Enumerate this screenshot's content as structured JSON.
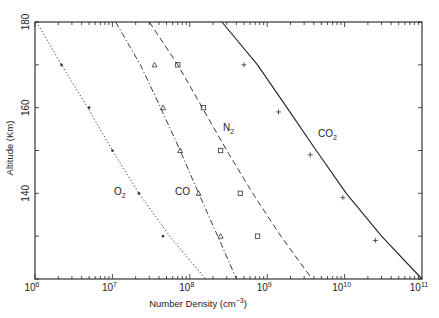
{
  "chart_data": {
    "type": "line",
    "title": "",
    "xlabel": "Number Density (cm⁻³)",
    "ylabel": "Altitude (Km)",
    "xscale": "log",
    "xlim": [
      1000000.0,
      100000000000.0
    ],
    "ylim": [
      120,
      180
    ],
    "grid": false,
    "legend": "inline labels",
    "x_ticks": [
      {
        "exp": "6",
        "label": "10"
      },
      {
        "exp": "7",
        "label": "10"
      },
      {
        "exp": "8",
        "label": "10"
      },
      {
        "exp": "9",
        "label": "10"
      },
      {
        "exp": "10",
        "label": "10"
      },
      {
        "exp": "11",
        "label": "10"
      }
    ],
    "y_ticks": [
      {
        "value": 140,
        "label": "140"
      },
      {
        "value": 160,
        "label": "160"
      },
      {
        "value": 180,
        "label": "180"
      }
    ],
    "series": [
      {
        "name": "O2",
        "label_main": "O",
        "label_sub": "2",
        "line_style": "dotted",
        "marker": "dot",
        "model_curve": [
          [
            1050000.0,
            180
          ],
          [
            2200000.0,
            170
          ],
          [
            4800000.0,
            160
          ],
          [
            10000000.0,
            150
          ],
          [
            22000000.0,
            140
          ],
          [
            55000000.0,
            130
          ],
          [
            160000000.0,
            120
          ]
        ],
        "observed": [
          [
            2200000.0,
            170
          ],
          [
            5000000.0,
            160
          ],
          [
            10000000.0,
            150
          ],
          [
            22000000.0,
            140
          ],
          [
            45000000.0,
            130
          ]
        ]
      },
      {
        "name": "CO",
        "label_main": "CO",
        "label_sub": "",
        "line_style": "dash-dot",
        "marker": "triangle",
        "model_curve": [
          [
            11000000.0,
            180
          ],
          [
            23000000.0,
            170
          ],
          [
            42000000.0,
            160
          ],
          [
            75000000.0,
            150
          ],
          [
            130000000.0,
            140
          ],
          [
            230000000.0,
            130
          ],
          [
            400000000.0,
            120
          ]
        ],
        "observed": [
          [
            35000000.0,
            170
          ],
          [
            45000000.0,
            160
          ],
          [
            75000000.0,
            150
          ],
          [
            130000000.0,
            140
          ],
          [
            250000000.0,
            130
          ]
        ]
      },
      {
        "name": "N2",
        "label_main": "N",
        "label_sub": "2",
        "line_style": "dashed",
        "marker": "square",
        "model_curve": [
          [
            30000000.0,
            180
          ],
          [
            70000000.0,
            170
          ],
          [
            145000000.0,
            160
          ],
          [
            300000000.0,
            150
          ],
          [
            650000000.0,
            140
          ],
          [
            1500000000.0,
            130
          ],
          [
            3800000000.0,
            120
          ]
        ],
        "observed": [
          [
            70000000.0,
            170
          ],
          [
            150000000.0,
            160
          ],
          [
            250000000.0,
            150
          ],
          [
            450000000.0,
            140
          ],
          [
            750000000.0,
            130
          ]
        ]
      },
      {
        "name": "CO2",
        "label_main": "CO",
        "label_sub": "2",
        "line_style": "solid",
        "marker": "plus",
        "model_curve": [
          [
            260000000.0,
            180
          ],
          [
            750000000.0,
            170
          ],
          [
            1800000000.0,
            160
          ],
          [
            4300000000.0,
            150
          ],
          [
            10500000000.0,
            140
          ],
          [
            30000000000.0,
            130
          ],
          [
            100000000000.0,
            120
          ]
        ],
        "observed": [
          [
            500000000.0,
            170
          ],
          [
            1400000000.0,
            159
          ],
          [
            3600000000.0,
            149
          ],
          [
            9500000000.0,
            139
          ],
          [
            25000000000.0,
            129
          ]
        ]
      }
    ]
  },
  "labels": {
    "x_axis_title_main": "Number Density (cm",
    "x_axis_title_exp": "−3",
    "x_axis_title_close": ")",
    "y_axis_title": "Altitude (Km)"
  }
}
